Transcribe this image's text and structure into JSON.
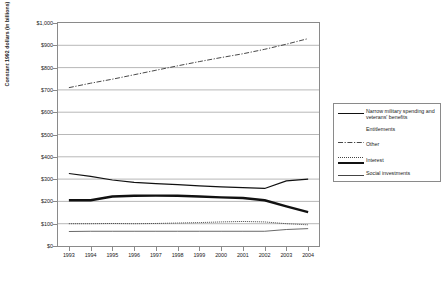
{
  "chart_data": {
    "type": "line",
    "title": "",
    "xlabel": "",
    "ylabel": "Constant 1992 dollars (in billions)",
    "categories": [
      "1993",
      "1994",
      "1995",
      "1996",
      "1997",
      "1998",
      "1999",
      "2000",
      "2001",
      "2002",
      "2003",
      "2004"
    ],
    "ylim": [
      0,
      1000
    ],
    "ytick_labels": [
      "$1,000",
      "$900",
      "$800",
      "$700",
      "$600",
      "$500",
      "$400",
      "$300",
      "$200",
      "$100",
      "$0"
    ],
    "ytick_values": [
      1000,
      900,
      800,
      700,
      600,
      500,
      400,
      300,
      200,
      100,
      0
    ],
    "grid": true,
    "legend_position": "right-outside",
    "series": [
      {
        "name": "Narrow military spending and veterans' benefits",
        "style": "solid",
        "values": [
          325,
          312,
          296,
          285,
          280,
          275,
          270,
          265,
          262,
          258,
          292,
          300
        ]
      },
      {
        "name": "Entitlements",
        "style": "dash-dot",
        "values": [
          710,
          730,
          748,
          768,
          788,
          808,
          827,
          845,
          862,
          882,
          905,
          930
        ]
      },
      {
        "name": "Other",
        "style": "dotted",
        "values": [
          100,
          100,
          101,
          100,
          101,
          103,
          105,
          108,
          110,
          108,
          100,
          95
        ]
      },
      {
        "name": "Interest",
        "style": "thick",
        "values": [
          205,
          205,
          222,
          225,
          226,
          225,
          222,
          218,
          215,
          205,
          178,
          152
        ]
      },
      {
        "name": "Social investments",
        "style": "thin",
        "values": [
          65,
          66,
          66,
          66,
          66,
          66,
          66,
          66,
          66,
          66,
          74,
          78
        ]
      }
    ]
  },
  "legend": {
    "items": [
      {
        "label": "Narrow military spending and veterans' benefits",
        "style": "solid"
      },
      {
        "label": "Entitlements",
        "style": "dash-dot"
      },
      {
        "label": "Other",
        "style": "dotted"
      },
      {
        "label": "Interest",
        "style": "thick"
      },
      {
        "label": "Social investments",
        "style": "thin"
      }
    ]
  },
  "colors": {
    "line": "#111111",
    "grid": "#9a9a9a",
    "frame": "#8a8a8a",
    "text": "#1a1a1a",
    "background": "#ffffff"
  }
}
